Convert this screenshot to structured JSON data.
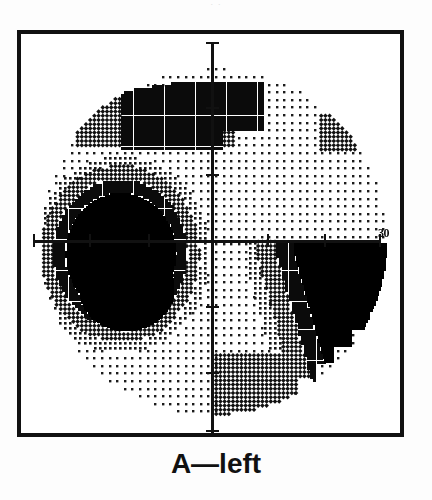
{
  "figure": {
    "caption": "A—left",
    "top_remnant": "· ·",
    "axis_label_right": "30"
  },
  "chart_data": {
    "type": "heatmap",
    "title": "A—left",
    "subtitle": "Humphrey visual field grayscale printout, left eye",
    "xlabel": "",
    "ylabel": "",
    "axis_labels": [
      "30"
    ],
    "xlim": [
      -30,
      30
    ],
    "ylim": [
      -30,
      30
    ],
    "grid": false,
    "legend_position": "none",
    "field_radius_deg": 30,
    "axis_ticks_deg": [
      -30,
      -20,
      -10,
      0,
      10,
      20,
      30
    ],
    "gray_levels": [
      {
        "name": "white",
        "symbol": "blank",
        "hex": "#ffffff",
        "db_range": "normal / >=30 dB"
      },
      {
        "name": "light-stipple",
        "symbol": "sparse dots",
        "hex": "#cfcfcf",
        "db_range": "25-29 dB"
      },
      {
        "name": "mid-stipple",
        "symbol": "dense dots",
        "hex": "#9a9a9a",
        "db_range": "20-24 dB"
      },
      {
        "name": "crosshatch",
        "symbol": "diagonal hatch",
        "hex": "#555555",
        "db_range": "10-19 dB"
      },
      {
        "name": "dark",
        "symbol": "near-solid",
        "hex": "#2b2b2b",
        "db_range": "5-9 dB"
      },
      {
        "name": "black",
        "symbol": "solid",
        "hex": "#000000",
        "db_range": "<5 dB (absolute)"
      }
    ],
    "defects": [
      {
        "name": "superior-arcuate-defect",
        "quadrant": "superior nasal and superior paracentral",
        "severity": "crosshatch / dense",
        "approx_center_deg": [
          -8,
          24
        ],
        "approx_extent_deg": [
          26,
          10
        ]
      },
      {
        "name": "superior-temporal-small-patch",
        "quadrant": "superior temporal periphery",
        "severity": "crosshatch",
        "approx_center_deg": [
          22,
          19
        ],
        "approx_extent_deg": [
          5,
          5
        ]
      },
      {
        "name": "nasal-step-dense-scotoma",
        "quadrant": "nasal, straddling horizontal midline",
        "severity": "absolute / black core with crosshatch halo",
        "approx_center_deg": [
          -16,
          -2
        ],
        "approx_extent_deg": [
          16,
          18
        ]
      },
      {
        "name": "inferior-temporal-absolute-defect",
        "quadrant": "inferior temporal",
        "severity": "absolute / solid black",
        "approx_center_deg": [
          20,
          -12
        ],
        "approx_extent_deg": [
          22,
          20
        ]
      },
      {
        "name": "inferior-nasal-of-vertical-midline-defect",
        "quadrant": "inferior, just temporal of vertical midline",
        "severity": "mid-dense stipple",
        "approx_center_deg": [
          6,
          -24
        ],
        "approx_extent_deg": [
          14,
          10
        ]
      }
    ],
    "background_pattern": "uniform sparse stipple within 30-degree circular field boundary"
  }
}
